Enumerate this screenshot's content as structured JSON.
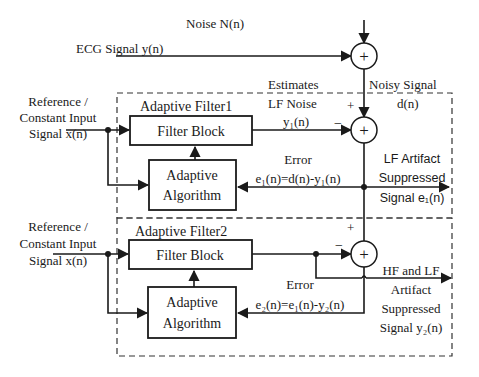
{
  "inputs": {
    "noise": "Noise N(n)",
    "ecg": "ECG Signal y(n)",
    "ref1_line1": "Reference /",
    "ref1_line2": "Constant Input",
    "ref1_line3": "Signal x(n)",
    "ref2_line1": "Reference /",
    "ref2_line2": "Constant Input",
    "ref2_line3": "Signal x(n)"
  },
  "stage1": {
    "title": "Adaptive Filter1",
    "filter_block": "Filter Block",
    "algo_line1": "Adaptive",
    "algo_line2": "Algorithm",
    "estimates_line1": "Estimates",
    "estimates_line2": "LF Noise",
    "y1": "y₁(n)",
    "noisy_line1": "Noisy Signal",
    "noisy_line2": "d(n)",
    "plus": "+",
    "minus": "−",
    "error_label": "Error",
    "error_eq": "e₁(n)=d(n)-y₁(n)",
    "out_line1": "LF Artifact",
    "out_line2": "Suppressed",
    "out_line3": "Signal e₁(n)"
  },
  "stage2": {
    "title": "Adaptive Filter2",
    "filter_block": "Filter Block",
    "algo_line1": "Adaptive",
    "algo_line2": "Algorithm",
    "plus": "+",
    "minus": "−",
    "error_label": "Error",
    "error_eq": "e₂(n)=e₁(n)-y₂(n)",
    "out_line1": "HF and LF",
    "out_line2": "Artifact",
    "out_line3": "Suppressed",
    "out_line4": "Signal y₂(n)"
  },
  "summing_symbol": "+"
}
